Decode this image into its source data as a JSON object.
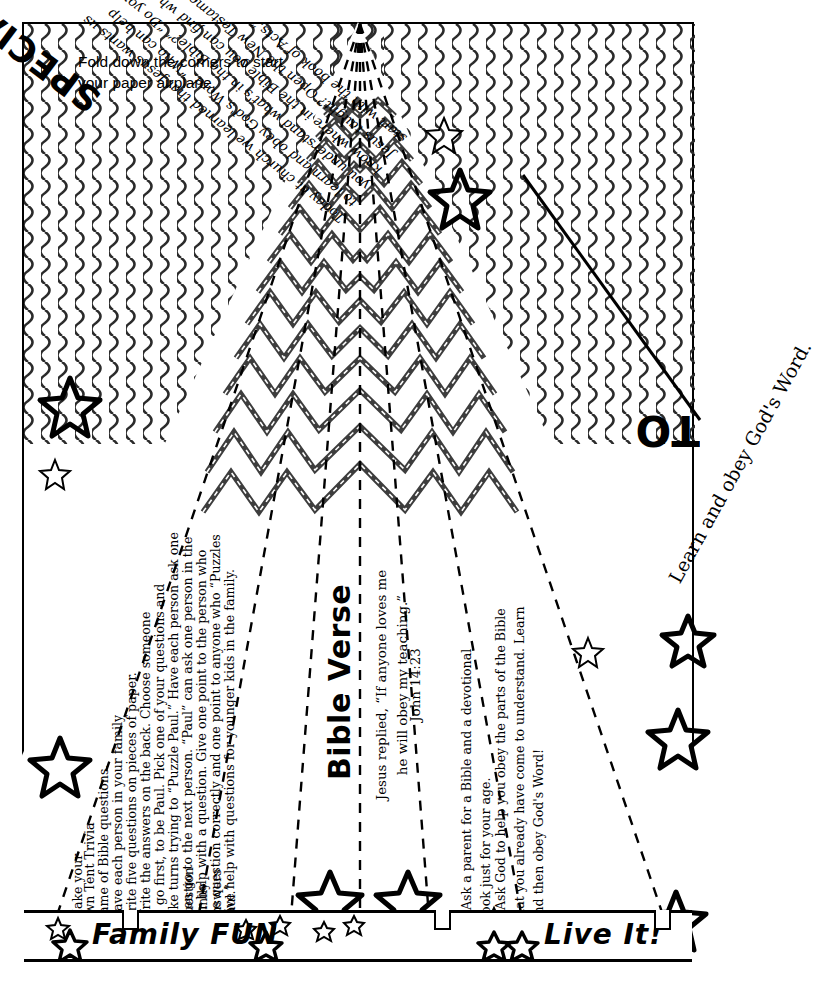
{
  "page": {
    "instruction": "Fold down the corners to start your paper airplane."
  },
  "headline": {
    "special_delivery": "SPECIAL DELIVERY",
    "to_label": "TO",
    "learn_and_obey": "Learn and obey God's Word."
  },
  "today_paragraph": "Today at church we learned that Jesus wants us to learn and obey God's Word. “Who can help you understand what's in the Bible?” “Do you know where in the Bible you can find what Jesus taught? Open the New Testament and start with the book of Acts.”",
  "family_fun": {
    "title": "Family FUN",
    "lines": [
      "Make your",
      "own Tent Trivia",
      "game of Bible questions.",
      "Have each person in your family",
      "write five questions on pieces of paper.",
      "Write the answers on the back. Choose someone",
      "to go first, to be Paul. Pick one of your questions and",
      "take turns trying to “Puzzle Paul.” Have each person ask one question",
      "then go to the next person. “Paul” can ask one person in the family",
      "for help with a question. Give one point to the person who answers",
      "the question correctly and one point to anyone who “Puzzles Paul.”",
      "Give help with questions for younger kids in the family."
    ]
  },
  "bible_verse": {
    "heading": "Bible Verse",
    "text": "Jesus replied, “If anyone loves me he will obey my teaching.”",
    "reference": "John 14:23"
  },
  "live_it": {
    "title": "Live It!",
    "bullets": [
      "Ask a parent for a Bible and a devotional book just for your age.",
      "Ask God to help you obey the parts of the Bible that you already have come to understand. Learn and then obey God's Word!"
    ]
  },
  "colors": {
    "ink": "#000000",
    "paper": "#ffffff",
    "pattern": "#333333"
  },
  "icons": {
    "star": "star-icon",
    "bullet": "square-bullet-icon",
    "clip": "paper-clip-icon"
  }
}
